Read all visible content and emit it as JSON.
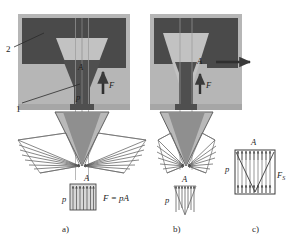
{
  "figure": {
    "title": "",
    "panels": [
      {
        "id": "a",
        "caption": "a)",
        "labels": {
          "area": "A",
          "pressure": "p",
          "force": "F",
          "equation": "F = pA",
          "callout_1": "1",
          "callout_2": "2"
        }
      },
      {
        "id": "b",
        "caption": "b)",
        "labels": {
          "area": "A",
          "pressure": "p",
          "force": "F"
        }
      },
      {
        "id": "c",
        "caption": "c)",
        "labels": {
          "area": "A",
          "pressure": "p",
          "force_s": "F",
          "force_s_sub": "S"
        }
      }
    ]
  },
  "colors": {
    "dark_block": "#4a4a4a",
    "mid_block": "#a8a8a8",
    "light_block": "#bdbdbd",
    "cone_fill": "#c9c9c9",
    "cone_dark": "#808080",
    "line": "#2b2b2b",
    "background": "#ffffff"
  }
}
